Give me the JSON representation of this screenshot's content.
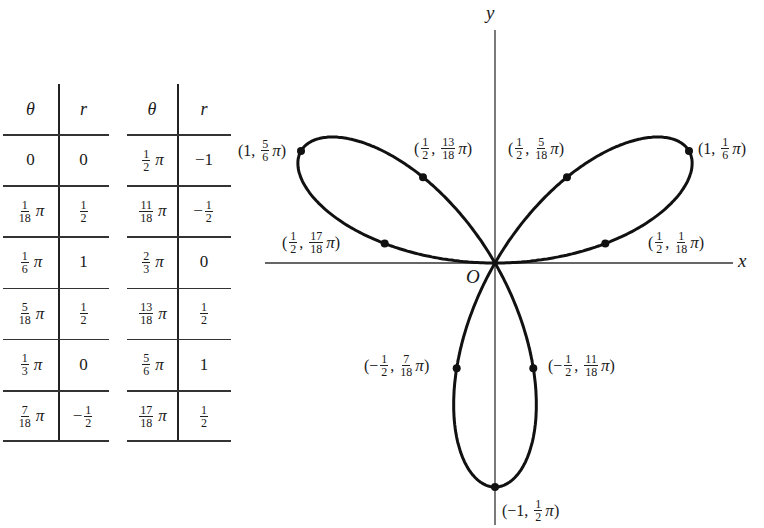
{
  "tables": [
    {
      "headers": {
        "theta": "θ",
        "r": "r"
      },
      "rows": [
        {
          "theta": {
            "whole": "0"
          },
          "r": {
            "whole": "0"
          }
        },
        {
          "theta": {
            "num": "1",
            "den": "18",
            "pi": "π"
          },
          "r": {
            "num": "1",
            "den": "2"
          }
        },
        {
          "theta": {
            "num": "1",
            "den": "6",
            "pi": "π"
          },
          "r": {
            "whole": "1"
          }
        },
        {
          "theta": {
            "num": "5",
            "den": "18",
            "pi": "π"
          },
          "r": {
            "num": "1",
            "den": "2"
          }
        },
        {
          "theta": {
            "num": "1",
            "den": "3",
            "pi": "π"
          },
          "r": {
            "whole": "0"
          }
        },
        {
          "theta": {
            "num": "7",
            "den": "18",
            "pi": "π"
          },
          "r": {
            "sign": "−",
            "num": "1",
            "den": "2"
          }
        }
      ]
    },
    {
      "headers": {
        "theta": "θ",
        "r": "r"
      },
      "rows": [
        {
          "theta": {
            "num": "1",
            "den": "2",
            "pi": "π"
          },
          "r": {
            "whole": "−1"
          }
        },
        {
          "theta": {
            "num": "11",
            "den": "18",
            "pi": "π"
          },
          "r": {
            "sign": "−",
            "num": "1",
            "den": "2"
          }
        },
        {
          "theta": {
            "num": "2",
            "den": "3",
            "pi": "π"
          },
          "r": {
            "whole": "0"
          }
        },
        {
          "theta": {
            "num": "13",
            "den": "18",
            "pi": "π"
          },
          "r": {
            "num": "1",
            "den": "2"
          }
        },
        {
          "theta": {
            "num": "5",
            "den": "6",
            "pi": "π"
          },
          "r": {
            "whole": "1"
          }
        },
        {
          "theta": {
            "num": "17",
            "den": "18",
            "pi": "π"
          },
          "r": {
            "num": "1",
            "den": "2"
          }
        }
      ]
    }
  ],
  "graph": {
    "x_axis_label": "x",
    "y_axis_label": "y",
    "origin_label": "O",
    "curve": "r = sin 3θ (three-leaved rose)",
    "line_color": "#111111",
    "points": [
      {
        "r": "1",
        "theta_num": "1",
        "theta_den": "6",
        "r_val": 1,
        "theta_val": 0.5236
      },
      {
        "r": "1",
        "theta_num": "5",
        "theta_den": "6",
        "r_val": 1,
        "theta_val": 2.618
      },
      {
        "r": "1/2",
        "theta_num": "1",
        "theta_den": "18",
        "r_val": 0.5,
        "theta_val": 0.1745
      },
      {
        "r": "1/2",
        "theta_num": "5",
        "theta_den": "18",
        "r_val": 0.5,
        "theta_val": 0.8727
      },
      {
        "r": "1/2",
        "theta_num": "13",
        "theta_den": "18",
        "r_val": 0.5,
        "theta_val": 2.2689
      },
      {
        "r": "1/2",
        "theta_num": "17",
        "theta_den": "18",
        "r_val": 0.5,
        "theta_val": 2.9671
      },
      {
        "r": "−1/2",
        "theta_num": "7",
        "theta_den": "18",
        "r_val": -0.5,
        "theta_val": 1.2217
      },
      {
        "r": "−1/2",
        "theta_num": "11",
        "theta_den": "18",
        "r_val": -0.5,
        "theta_val": 1.9199
      },
      {
        "r": "−1",
        "theta_num": "1",
        "theta_den": "2",
        "r_val": -1,
        "theta_val": 1.5708
      }
    ],
    "labels": {
      "p_5_6": {
        "r": "1",
        "num": "5",
        "den": "6",
        "pi": "π"
      },
      "p_13_18": {
        "rnum": "1",
        "rden": "2",
        "num": "13",
        "den": "18",
        "pi": "π"
      },
      "p_5_18": {
        "rnum": "1",
        "rden": "2",
        "num": "5",
        "den": "18",
        "pi": "π"
      },
      "p_1_6": {
        "r": "1",
        "num": "1",
        "den": "6",
        "pi": "π"
      },
      "p_17_18": {
        "rnum": "1",
        "rden": "2",
        "num": "17",
        "den": "18",
        "pi": "π"
      },
      "p_1_18": {
        "rnum": "1",
        "rden": "2",
        "num": "1",
        "den": "18",
        "pi": "π"
      },
      "p_7_18": {
        "sign": "−",
        "rnum": "1",
        "rden": "2",
        "num": "7",
        "den": "18",
        "pi": "π"
      },
      "p_11_18": {
        "sign": "−",
        "rnum": "1",
        "rden": "2",
        "num": "11",
        "den": "18",
        "pi": "π"
      },
      "p_1_2": {
        "r": "−1",
        "num": "1",
        "den": "2",
        "pi": "π"
      }
    }
  }
}
